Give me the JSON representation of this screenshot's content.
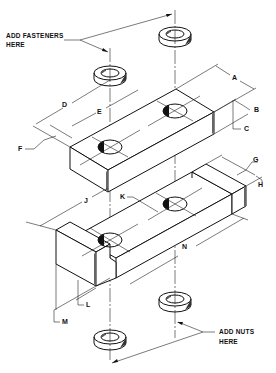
{
  "notes": {
    "fasteners_line1": "ADD  FASTENERS",
    "fasteners_line2": "HERE",
    "nuts_line1": "ADD NUTS",
    "nuts_line2": "HERE"
  },
  "dimensions": {
    "A": "A",
    "B": "B",
    "C": "C",
    "D": "D",
    "E": "E",
    "F": "F",
    "G": "G",
    "H": "H",
    "J": "J",
    "K": "K",
    "L": "L",
    "M": "M",
    "N": "N"
  },
  "parts": [
    "washer-top-left",
    "washer-top-right",
    "upper-block",
    "lower-channel",
    "washer-bottom-left",
    "washer-bottom-right"
  ]
}
